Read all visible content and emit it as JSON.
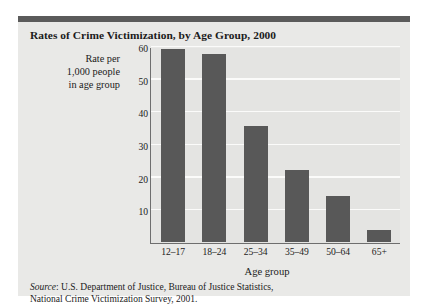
{
  "figure": {
    "title": "Rates of Crime Victimization, by Age Group, 2000",
    "y_caption_lines": [
      "Rate per",
      "1,000 people",
      "in age group"
    ],
    "source_prefix": "Source",
    "source_line1": ": U.S. Department of Justice, Bureau of Justice Statistics,",
    "source_line2": "National Crime Victimization Survey, 2001.",
    "accent_color": "#5b5b5b",
    "panel_color": "#e9e9e7",
    "bar_color": "#585858",
    "gridline_color": "#fbfbfa"
  },
  "chart_data": {
    "type": "bar",
    "title": "Rates of Crime Victimization, by Age Group, 2000",
    "subtitle": "",
    "xlabel": "Age group",
    "ylabel": "Rate per 1,000 people in age group",
    "categories": [
      "12–17",
      "18–24",
      "25–34",
      "35–49",
      "50–64",
      "65+"
    ],
    "values": [
      59,
      57.5,
      35.5,
      22,
      14,
      3.5
    ],
    "ylim": [
      0,
      60
    ],
    "yticks": [
      10,
      20,
      30,
      40,
      50,
      60
    ],
    "ytick_labels": [
      "10",
      "20",
      "30",
      "40",
      "50",
      "60"
    ],
    "grid": "horizontal",
    "legend": "none",
    "annotations": [],
    "source": "Source: U.S. Department of Justice, Bureau of Justice Statistics, National Crime Victimization Survey, 2001."
  }
}
